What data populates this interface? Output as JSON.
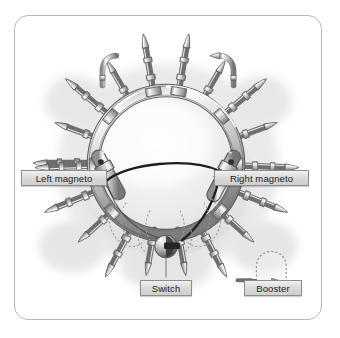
{
  "figure": {
    "caption": "",
    "frame_color": "#b9b9b9",
    "background_color": "#ffffff"
  },
  "callouts": [
    {
      "id": "left-magneto",
      "label": "Left magneto"
    },
    {
      "id": "right-magneto",
      "label": "Right magneto"
    },
    {
      "id": "switch",
      "label": "Switch"
    },
    {
      "id": "booster",
      "label": "Booster"
    }
  ],
  "diagram": {
    "component_names": [
      "ignition-harness-ring",
      "spark-plug-leads",
      "spark-plugs",
      "lead-connectors",
      "left-magneto-body",
      "right-magneto-body",
      "ignition-switch-knob",
      "booster-coil-outline",
      "switch-leader-line",
      "booster-leader-arrow"
    ],
    "colors": {
      "metal_light": "#f2f2f2",
      "metal_mid": "#c4c4c4",
      "metal_dark": "#8a8a8a",
      "outline": "#5a5a5a",
      "shadow": "#bcbcbc",
      "wire_dark": "#2b2b2b",
      "dotted_outline": "#9a9a9a"
    },
    "counts": {
      "spark_plug_leads": 18
    }
  }
}
